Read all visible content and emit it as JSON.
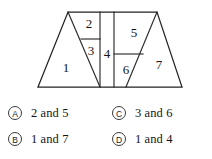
{
  "figure": {
    "outline_shape": "trapezoid",
    "stroke_color": "#2a2a2a",
    "fill_color": "#ffffff",
    "regions": [
      {
        "id": "1",
        "label": "1"
      },
      {
        "id": "2",
        "label": "2"
      },
      {
        "id": "3",
        "label": "3"
      },
      {
        "id": "4",
        "label": "4"
      },
      {
        "id": "5",
        "label": "5"
      },
      {
        "id": "6",
        "label": "6"
      },
      {
        "id": "7",
        "label": "7"
      }
    ]
  },
  "options": [
    {
      "letter": "A",
      "text": "2 and 5"
    },
    {
      "letter": "B",
      "text": "1 and 7"
    },
    {
      "letter": "C",
      "text": "3 and 6"
    },
    {
      "letter": "D",
      "text": "1 and 4"
    }
  ]
}
